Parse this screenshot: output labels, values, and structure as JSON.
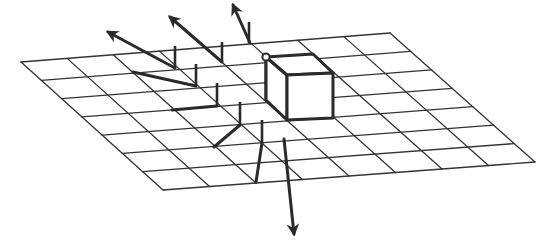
{
  "figure": {
    "top_caption_cropped": "",
    "colors": {
      "background": "#ffffff",
      "grid": "#333333",
      "vectors": "#2a2a2a"
    },
    "grid": {
      "columns": 8,
      "rows": 7,
      "corners": {
        "top_left": [
          21,
          62
        ],
        "top_right": [
          390,
          33
        ],
        "bottom_right": [
          535,
          162
        ],
        "bottom_left": [
          163,
          190
        ]
      }
    },
    "cube": {
      "vertices": {
        "top_back_left": [
          266,
          57
        ],
        "top_back_right": [
          313,
          54
        ],
        "top_front_left": [
          287,
          75
        ],
        "top_front_right": [
          333,
          73
        ],
        "bottom_front_left": [
          287,
          120
        ],
        "bottom_front_right": [
          333,
          118
        ],
        "bottom_back_left": [
          266,
          100
        ]
      },
      "marker_vertex": "top_back_left"
    },
    "vectors": [
      {
        "id": "v1",
        "stub": [
          [
            175,
            46
          ],
          [
            175,
            68
          ]
        ],
        "line": [
          [
            175,
            68
          ],
          [
            108,
            32
          ]
        ],
        "arrowhead": true
      },
      {
        "id": "v2",
        "stub": [
          [
            222,
            42
          ],
          [
            222,
            62
          ]
        ],
        "line": [
          [
            222,
            62
          ],
          [
            170,
            17
          ]
        ],
        "arrowhead": true
      },
      {
        "id": "v3",
        "stub": [
          [
            249,
            22
          ],
          [
            249,
            43
          ]
        ],
        "line": [
          [
            250,
            43
          ],
          [
            233,
            5
          ]
        ],
        "arrowhead": true
      },
      {
        "id": "v4",
        "stub": [
          [
            196,
            64
          ],
          [
            196,
            86
          ]
        ],
        "line": [
          [
            196,
            86
          ],
          [
            133,
            72
          ]
        ],
        "arrowhead": false
      },
      {
        "id": "v5",
        "stub": [
          [
            217,
            83
          ],
          [
            217,
            106
          ]
        ],
        "line": [
          [
            217,
            106
          ],
          [
            172,
            110
          ]
        ],
        "arrowhead": false
      },
      {
        "id": "v6",
        "stub": [
          [
            240,
            102
          ],
          [
            240,
            125
          ]
        ],
        "line": [
          [
            240,
            125
          ],
          [
            214,
            147
          ]
        ],
        "arrowhead": false
      },
      {
        "id": "v7",
        "stub": [
          [
            262,
            120
          ],
          [
            262,
            143
          ]
        ],
        "line": [
          [
            262,
            143
          ],
          [
            256,
            182
          ]
        ],
        "arrowhead": false
      },
      {
        "id": "v8",
        "stub": null,
        "line": [
          [
            284,
            139
          ],
          [
            294,
            234
          ]
        ],
        "arrowhead": true
      }
    ]
  }
}
